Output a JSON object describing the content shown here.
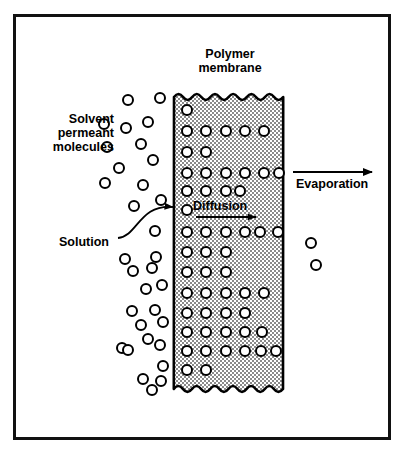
{
  "figure": {
    "background_color": "#ffffff",
    "frame_color": "#111111"
  },
  "labels": {
    "polymer_membrane": "Polymer\nmembrane",
    "solvent_permeant_molecules": "Solvent\npermeant\nmolecules",
    "solution": "Solution",
    "diffusion": "Diffusion",
    "evaporation": "Evaporation"
  },
  "membrane": {
    "fill_color": "#c9c9c9",
    "outline_color": "#000000",
    "left": 174,
    "right": 283,
    "top": 92,
    "bottom": 394,
    "edge_style": "wavy",
    "molecule_rows": [
      {
        "y": 110,
        "x": [
          187
        ]
      },
      {
        "y": 131,
        "x": [
          187,
          206,
          226,
          245,
          264
        ]
      },
      {
        "y": 152,
        "x": [
          187,
          206
        ]
      },
      {
        "y": 173,
        "x": [
          187,
          206,
          226,
          245,
          264,
          279
        ]
      },
      {
        "y": 191,
        "x": [
          187,
          206,
          226,
          240
        ]
      },
      {
        "y": 210,
        "x": [
          187
        ]
      },
      {
        "y": 232,
        "x": [
          187,
          206,
          226,
          245,
          260,
          278
        ]
      },
      {
        "y": 252,
        "x": [
          187,
          206,
          226
        ]
      },
      {
        "y": 272,
        "x": [
          187,
          206,
          226
        ]
      },
      {
        "y": 293,
        "x": [
          187,
          206,
          226,
          245,
          264
        ]
      },
      {
        "y": 313,
        "x": [
          187,
          206,
          226,
          245
        ]
      },
      {
        "y": 332,
        "x": [
          187,
          206,
          226,
          245,
          262
        ]
      },
      {
        "y": 351,
        "x": [
          187,
          206,
          226,
          245,
          261,
          276
        ]
      },
      {
        "y": 370,
        "x": [
          187,
          206
        ]
      }
    ]
  },
  "solution_molecules": [
    {
      "x": 128,
      "y": 100
    },
    {
      "x": 160,
      "y": 98
    },
    {
      "x": 104,
      "y": 124
    },
    {
      "x": 126,
      "y": 128
    },
    {
      "x": 148,
      "y": 122
    },
    {
      "x": 107,
      "y": 147
    },
    {
      "x": 141,
      "y": 144
    },
    {
      "x": 119,
      "y": 168
    },
    {
      "x": 153,
      "y": 160
    },
    {
      "x": 105,
      "y": 183
    },
    {
      "x": 143,
      "y": 185
    },
    {
      "x": 134,
      "y": 206
    },
    {
      "x": 161,
      "y": 200
    },
    {
      "x": 155,
      "y": 231
    },
    {
      "x": 125,
      "y": 259
    },
    {
      "x": 156,
      "y": 257
    },
    {
      "x": 133,
      "y": 271
    },
    {
      "x": 152,
      "y": 268
    },
    {
      "x": 162,
      "y": 285
    },
    {
      "x": 146,
      "y": 289
    },
    {
      "x": 132,
      "y": 311
    },
    {
      "x": 155,
      "y": 310
    },
    {
      "x": 141,
      "y": 325
    },
    {
      "x": 163,
      "y": 322
    },
    {
      "x": 148,
      "y": 339
    },
    {
      "x": 122,
      "y": 348
    },
    {
      "x": 160,
      "y": 345
    },
    {
      "x": 128,
      "y": 350
    },
    {
      "x": 163,
      "y": 366
    },
    {
      "x": 143,
      "y": 379
    },
    {
      "x": 161,
      "y": 381
    },
    {
      "x": 152,
      "y": 390
    }
  ],
  "evaporated_molecules": [
    {
      "x": 311,
      "y": 243
    },
    {
      "x": 316,
      "y": 265
    }
  ],
  "arrows": {
    "evaporation": {
      "x1": 293,
      "y1": 172,
      "x2": 372,
      "y2": 172
    },
    "diffusion": {
      "x1": 196,
      "y1": 217,
      "x2": 256,
      "y2": 217
    },
    "solution": {
      "from_x": 118,
      "from_y": 238,
      "to_x": 173,
      "to_y": 207,
      "curved": true
    }
  },
  "molecule_style": {
    "radius": 5,
    "fill": "#ffffff",
    "stroke": "#000000",
    "stroke_width": 2
  }
}
